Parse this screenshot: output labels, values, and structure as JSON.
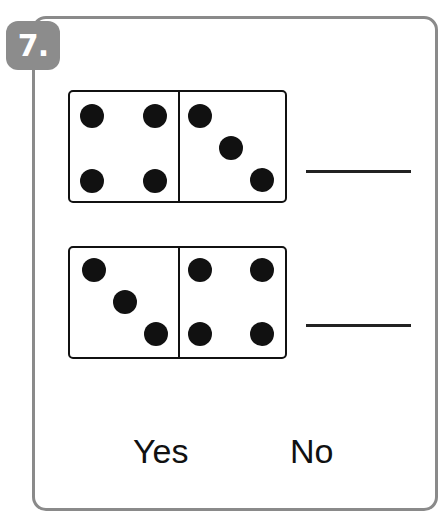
{
  "problem": {
    "number_label": "7.",
    "dominoes": [
      {
        "left_pips": 4,
        "right_pips": 3,
        "answer_line": ""
      },
      {
        "left_pips": 3,
        "right_pips": 4,
        "answer_line": ""
      }
    ],
    "choices": [
      "Yes",
      "No"
    ]
  },
  "colors": {
    "frame": "#8a8a8a",
    "badge": "#8c8c8c",
    "ink": "#111111"
  }
}
